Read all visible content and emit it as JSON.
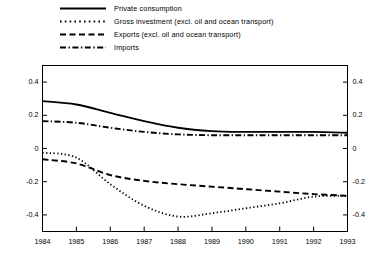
{
  "chart_data": {
    "type": "line",
    "title": "",
    "subtitle": "",
    "xlabel": "",
    "ylabel": "",
    "xlim": [
      1984,
      1993
    ],
    "ylim": [
      -0.5,
      0.5
    ],
    "grid": false,
    "legend_position": "top",
    "x": [
      1984,
      1985,
      1986,
      1987,
      1988,
      1989,
      1990,
      1991,
      1992,
      1993
    ],
    "x_tick_labels": [
      "1984",
      "1985",
      "1986",
      "1987",
      "1988",
      "1989",
      "1990",
      "1991",
      "1992",
      "1993"
    ],
    "y_ticks": [
      0.4,
      0.2,
      0.0,
      -0.2,
      -0.4
    ],
    "y_tick_labels": [
      "0.4",
      "0.2",
      "0",
      "-0.2",
      "-0.4"
    ],
    "y_ticks_right": [
      0.4,
      0.2,
      0.0,
      -0.2,
      -0.4
    ],
    "y_tick_labels_right": [
      "0.4",
      "0.2",
      "0",
      "-0.2",
      "-0.4"
    ],
    "series": [
      {
        "name": "Private consumption",
        "style": "solid",
        "color": "#000000",
        "values": [
          0.285,
          0.265,
          0.215,
          0.165,
          0.125,
          0.105,
          0.1,
          0.1,
          0.1,
          0.095
        ]
      },
      {
        "name": "Gross investment (excl. oil and ocean transport)",
        "style": "dotted",
        "color": "#000000",
        "values": [
          -0.025,
          -0.055,
          -0.215,
          -0.345,
          -0.41,
          -0.39,
          -0.36,
          -0.33,
          -0.29,
          -0.285
        ]
      },
      {
        "name": "Exports (excl. oil and ocean transport)",
        "style": "dashed",
        "color": "#000000",
        "values": [
          -0.065,
          -0.09,
          -0.16,
          -0.195,
          -0.215,
          -0.23,
          -0.245,
          -0.26,
          -0.275,
          -0.285
        ]
      },
      {
        "name": "Imports",
        "style": "dash-dot",
        "color": "#000000",
        "values": [
          0.165,
          0.155,
          0.125,
          0.1,
          0.085,
          0.08,
          0.08,
          0.08,
          0.08,
          0.08
        ]
      }
    ]
  },
  "legend": {
    "items": [
      {
        "label": "Private consumption",
        "style": "solid"
      },
      {
        "label": "Gross investment (excl. oil and ocean transport)",
        "style": "dotted"
      },
      {
        "label": "Exports (excl. oil and ocean transport)",
        "style": "dashed"
      },
      {
        "label": "Imports",
        "style": "dash-dot"
      }
    ]
  },
  "axes": {
    "frame_color": "#000000"
  }
}
